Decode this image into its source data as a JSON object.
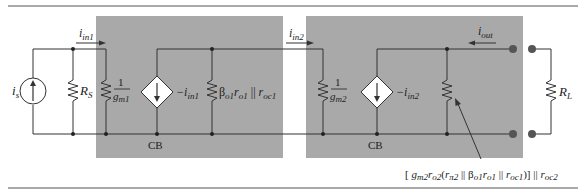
{
  "figure": {
    "type": "circuit-small-signal-model",
    "colors": {
      "block_fill": "#a9a9a9",
      "wire": "#333333",
      "rule": "#555555",
      "background": "#ffffff"
    },
    "blocks": [
      {
        "id": "stage1",
        "label": "CB"
      },
      {
        "id": "stage2",
        "label": "CB"
      }
    ],
    "source": {
      "symbol": "i",
      "sub": "s"
    },
    "resistors": {
      "rs": {
        "symbol": "R",
        "sub": "S"
      },
      "rin1": {
        "num": "1",
        "den_symbol": "g",
        "den_sub": "m1"
      },
      "rout1": {
        "text": "β",
        "sub1": "o1",
        "r": "r",
        "sub2": "o1",
        "par": " || ",
        "r2": "r",
        "sub3": "oc1"
      },
      "rin2": {
        "num": "1",
        "den_symbol": "g",
        "den_sub": "m2"
      },
      "rl": {
        "symbol": "R",
        "sub": "L"
      }
    },
    "dependent_sources": [
      {
        "id": "cccs1",
        "label": "−i",
        "sub": "in1"
      },
      {
        "id": "cccs2",
        "label": "−i",
        "sub": "in2"
      }
    ],
    "currents": [
      {
        "id": "iin1",
        "symbol": "i",
        "sub": "in1",
        "direction": "right"
      },
      {
        "id": "iin2",
        "symbol": "i",
        "sub": "in2",
        "direction": "right"
      },
      {
        "id": "iout",
        "symbol": "i",
        "sub": "out",
        "direction": "left"
      }
    ],
    "annotation": {
      "open": "[ ",
      "g": "g",
      "g_sub": "m2",
      "r": "r",
      "r_sub": "o2",
      "paren_open": "(",
      "rpi": "r",
      "rpi_sub": "π2",
      "par1": " || ",
      "beta": "β",
      "beta_sub": "o1",
      "ro": "r",
      "ro_sub": "o1",
      "par2": " || ",
      "roc": "r",
      "roc_sub": "oc1",
      "close": ")] || ",
      "roc2": "r",
      "roc2_sub": "oc2"
    }
  }
}
